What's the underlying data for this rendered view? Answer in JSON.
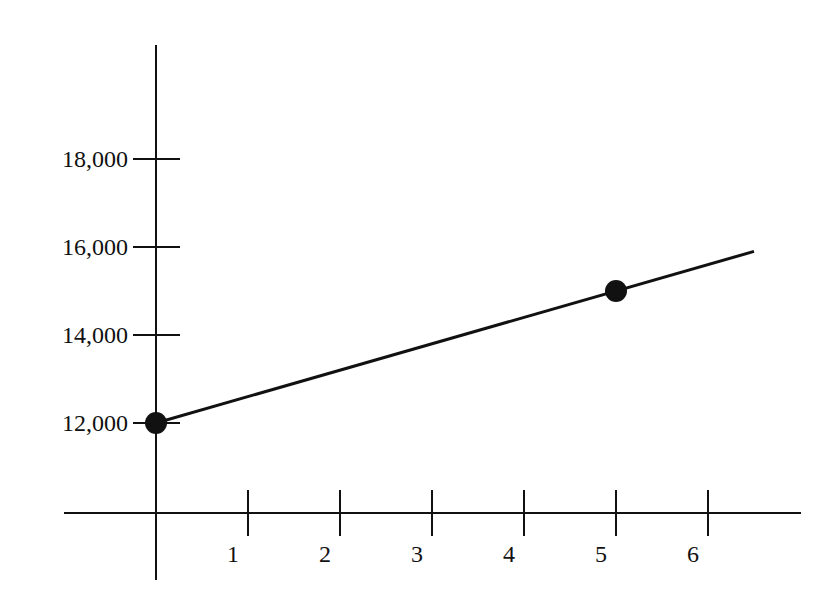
{
  "chart_data": {
    "type": "line",
    "title": "",
    "xlabel": "",
    "ylabel": "",
    "x_ticks": [
      1,
      2,
      3,
      4,
      5,
      6
    ],
    "x_tick_labels": [
      "1",
      "2",
      "3",
      "4",
      "5",
      "6"
    ],
    "y_ticks": [
      12000,
      14000,
      16000,
      18000
    ],
    "y_tick_labels": [
      "12,000",
      "14,000",
      "16,000",
      "18,000"
    ],
    "xlim": [
      -1,
      7
    ],
    "ylim": [
      9900,
      22000
    ],
    "grid": false,
    "legend": null,
    "series": [
      {
        "name": "line",
        "x": [
          0,
          6.5
        ],
        "y": [
          12000,
          15900
        ],
        "color": "#111111"
      }
    ],
    "points": [
      {
        "x": 0,
        "y": 12000
      },
      {
        "x": 5,
        "y": 15000
      }
    ]
  },
  "colors": {
    "ink": "#111111",
    "background": "#ffffff"
  }
}
